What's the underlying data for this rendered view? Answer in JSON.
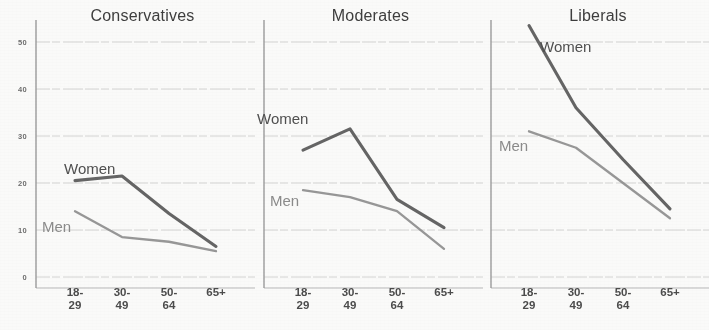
{
  "chart_data": {
    "type": "line",
    "title": "",
    "xlabel": "",
    "ylabel": "",
    "ylim": [
      0,
      50
    ],
    "yticks": [
      0,
      10,
      20,
      30,
      40,
      50
    ],
    "ytick_labels": [
      "0",
      "10",
      "20",
      "30",
      "40",
      "50"
    ],
    "grid": true,
    "legend_position": "inline-labels",
    "categories": [
      "18–29",
      "30–49",
      "50–64",
      "65+"
    ],
    "category_lines": [
      [
        "18-",
        "29"
      ],
      [
        "30-",
        "49"
      ],
      [
        "50-",
        "64"
      ],
      [
        "65+",
        ""
      ]
    ],
    "panels": [
      {
        "title": "Conservatives",
        "series": [
          {
            "name": "Women",
            "color": "#565656",
            "values": [
              20.5,
              21.5,
              13.5,
              6.5
            ],
            "label": "Women"
          },
          {
            "name": "Men",
            "color": "#8d8d8d",
            "values": [
              14.0,
              8.5,
              7.5,
              5.5
            ],
            "label": "Men"
          }
        ]
      },
      {
        "title": "Moderates",
        "series": [
          {
            "name": "Women",
            "color": "#565656",
            "values": [
              27.0,
              31.5,
              16.5,
              10.5
            ],
            "label": "Women"
          },
          {
            "name": "Men",
            "color": "#8d8d8d",
            "values": [
              18.5,
              17.0,
              14.0,
              6.0
            ],
            "label": "Men"
          }
        ]
      },
      {
        "title": "Liberals",
        "series": [
          {
            "name": "Women",
            "color": "#565656",
            "values": [
              53.5,
              36.0,
              25.0,
              14.5
            ],
            "label": "Women"
          },
          {
            "name": "Men",
            "color": "#8d8d8d",
            "values": [
              31.0,
              27.5,
              20.0,
              12.5
            ],
            "label": "Men"
          }
        ]
      }
    ]
  },
  "axis": {
    "tick_0": "0",
    "tick_10": "10",
    "tick_20": "20",
    "tick_30": "30",
    "tick_40": "40",
    "tick_50": "50"
  },
  "panel_titles": {
    "conservatives": "Conservatives",
    "moderates": "Moderates",
    "liberals": "Liberals"
  },
  "series_labels": {
    "women": "Women",
    "men": "Men"
  },
  "xtick_labels": {
    "a_top": "18-",
    "a_bottom": "29",
    "b_top": "30-",
    "b_bottom": "49",
    "c_top": "50-",
    "c_bottom": "64",
    "d_top": "65+",
    "d_bottom": ""
  }
}
